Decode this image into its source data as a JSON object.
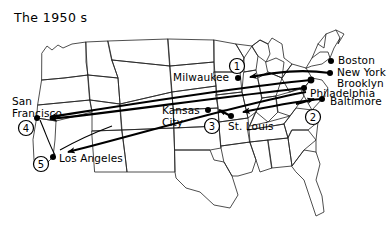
{
  "title": "The 1950 s",
  "map": {
    "region": "united-states",
    "outline_color": "#111111",
    "route_color": "#000000",
    "background": "#ffffff"
  },
  "cities": [
    {
      "id": "boston",
      "name": "Boston",
      "x": 331,
      "y": 61,
      "label_x": 338,
      "label_y": 55,
      "anchor": "left"
    },
    {
      "id": "new-york",
      "name": "New York",
      "x": 330,
      "y": 73,
      "label_x": 337,
      "label_y": 68,
      "anchor": "left"
    },
    {
      "id": "brooklyn",
      "name": "Brooklyn",
      "x": 311,
      "y": 80,
      "label_x": 337,
      "label_y": 79,
      "anchor": "left"
    },
    {
      "id": "philadelphia",
      "name": "Philadelphia",
      "x": 304,
      "y": 88,
      "label_x": 311,
      "label_y": 88,
      "anchor": "left"
    },
    {
      "id": "baltimore",
      "name": "Baltimore",
      "x": 322,
      "y": 99,
      "label_x": 330,
      "label_y": 97,
      "anchor": "left"
    },
    {
      "id": "milwaukee",
      "name": "Milwaukee",
      "x": 238,
      "y": 78,
      "label_x": 175,
      "label_y": 72,
      "anchor": "left"
    },
    {
      "id": "kansas-city",
      "name": "Kansas\nCity",
      "x": 208,
      "y": 110,
      "label_x": 163,
      "label_y": 112,
      "anchor": "left"
    },
    {
      "id": "st-louis",
      "name": "St. Louis",
      "x": 231,
      "y": 116,
      "label_x": 230,
      "label_y": 122,
      "anchor": "left"
    },
    {
      "id": "san-francisco",
      "name": "San\nFrancisco",
      "x": 37,
      "y": 118,
      "label_x": 14,
      "label_y": 100,
      "anchor": "left"
    },
    {
      "id": "los-angeles",
      "name": "Los Angeles",
      "x": 53,
      "y": 157,
      "label_x": 60,
      "label_y": 158,
      "anchor": "left"
    }
  ],
  "markers": [
    {
      "id": "marker-1",
      "label": "1",
      "x": 237,
      "y": 66
    },
    {
      "id": "marker-2",
      "label": "2",
      "x": 313,
      "y": 117
    },
    {
      "id": "marker-3",
      "label": "3",
      "x": 212,
      "y": 126
    },
    {
      "id": "marker-4",
      "label": "4",
      "x": 26,
      "y": 128
    },
    {
      "id": "marker-5",
      "label": "5",
      "x": 41,
      "y": 164
    }
  ],
  "routes": [
    {
      "id": "route-ny-milwaukee",
      "from": "new-york",
      "to": "milwaukee",
      "order": 1
    },
    {
      "id": "route-balt-stlouis",
      "from": "baltimore",
      "to": "st-louis",
      "order": 2
    },
    {
      "id": "route-stlouis-kc",
      "from": "st-louis",
      "to": "kansas-city",
      "order": 3
    },
    {
      "id": "route-brooklyn-sf",
      "from": "brooklyn",
      "to": "san-francisco",
      "order": 4
    },
    {
      "id": "route-phil-la",
      "from": "philadelphia",
      "to": "los-angeles",
      "order": 5
    }
  ]
}
